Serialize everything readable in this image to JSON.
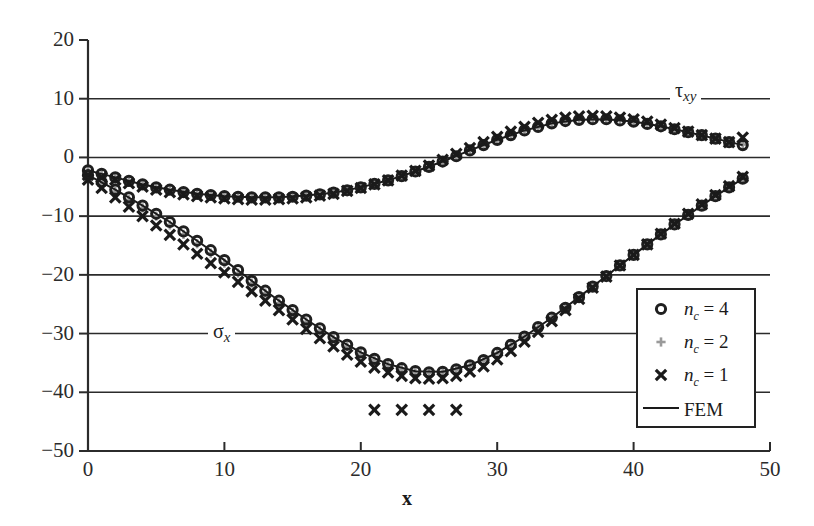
{
  "chart_data": {
    "type": "scatter",
    "title": "",
    "xlabel": "x",
    "ylabel": "",
    "xlim": [
      0,
      50
    ],
    "ylim": [
      -50,
      20
    ],
    "xticks": [
      "0",
      "10",
      "20",
      "30",
      "40",
      "50"
    ],
    "yticks": [
      "20",
      "10",
      "0",
      "-10",
      "-20",
      "-30",
      "-40",
      "-50"
    ],
    "grid": "horizontal",
    "legend_position": "lower-right-inside",
    "annotations": [
      {
        "text": "tau_xy",
        "x": 46.5,
        "y": 10
      },
      {
        "text": "sigma_x",
        "x": 10.5,
        "y": -30
      }
    ],
    "series": [
      {
        "name": "tau_xy FEM",
        "curve": "tau_xy",
        "marker": "line",
        "color": "#1a1a1a",
        "x": [
          0,
          2,
          4,
          6,
          8,
          10,
          12,
          14,
          16,
          18,
          20,
          22,
          24,
          26,
          28,
          30,
          32,
          34,
          36,
          38,
          40,
          42,
          44,
          46,
          48
        ],
        "y": [
          -2.2,
          -3.4,
          -4.6,
          -5.5,
          -6.2,
          -6.6,
          -6.8,
          -6.8,
          -6.5,
          -6.0,
          -5.1,
          -3.9,
          -2.4,
          -0.7,
          1.2,
          3.0,
          4.6,
          5.8,
          6.4,
          6.5,
          6.1,
          5.3,
          4.3,
          3.2,
          2.1
        ]
      },
      {
        "name": "tau_xy nc=4",
        "curve": "tau_xy",
        "marker": "circle",
        "color": "#1f1f1f",
        "x": [
          0,
          1,
          2,
          3,
          4,
          5,
          6,
          7,
          8,
          9,
          10,
          11,
          12,
          13,
          14,
          15,
          16,
          17,
          18,
          19,
          20,
          21,
          22,
          23,
          24,
          25,
          26,
          27,
          28,
          29,
          30,
          31,
          32,
          33,
          34,
          35,
          36,
          37,
          38,
          39,
          40,
          41,
          42,
          43,
          44,
          45,
          46,
          47,
          48
        ],
        "y": [
          -2.2,
          -2.8,
          -3.4,
          -4.0,
          -4.6,
          -5.1,
          -5.5,
          -5.9,
          -6.2,
          -6.4,
          -6.6,
          -6.7,
          -6.8,
          -6.8,
          -6.8,
          -6.7,
          -6.5,
          -6.3,
          -6.0,
          -5.6,
          -5.1,
          -4.5,
          -3.9,
          -3.2,
          -2.4,
          -1.6,
          -0.7,
          0.2,
          1.2,
          2.1,
          3.0,
          3.8,
          4.6,
          5.2,
          5.8,
          6.2,
          6.4,
          6.5,
          6.5,
          6.3,
          6.1,
          5.7,
          5.3,
          4.8,
          4.3,
          3.8,
          3.2,
          2.6,
          2.1
        ]
      },
      {
        "name": "tau_xy nc=2",
        "curve": "tau_xy",
        "marker": "plus",
        "color": "#9a9a9a",
        "x": [
          0,
          1,
          2,
          3,
          4,
          5,
          6,
          7,
          8,
          9,
          10,
          11,
          12,
          13,
          14,
          15,
          16,
          17,
          18,
          19,
          20,
          21,
          22,
          23,
          24,
          25,
          26,
          27,
          28,
          29,
          30,
          31,
          32,
          33,
          34,
          35,
          36,
          37,
          38,
          39,
          40,
          41,
          42,
          43,
          44,
          45,
          46,
          47,
          48
        ],
        "y": [
          -2.4,
          -3.0,
          -3.6,
          -4.2,
          -4.7,
          -5.2,
          -5.6,
          -6.0,
          -6.3,
          -6.5,
          -6.7,
          -6.8,
          -6.9,
          -6.9,
          -6.9,
          -6.8,
          -6.6,
          -6.4,
          -6.1,
          -5.7,
          -5.2,
          -4.6,
          -4.0,
          -3.3,
          -2.5,
          -1.7,
          -0.8,
          0.1,
          1.1,
          2.0,
          2.9,
          3.7,
          4.5,
          5.1,
          5.7,
          6.1,
          6.4,
          6.5,
          6.5,
          6.4,
          6.1,
          5.8,
          5.4,
          4.9,
          4.4,
          3.9,
          3.3,
          2.7,
          2.2
        ]
      },
      {
        "name": "tau_xy nc=1",
        "curve": "tau_xy",
        "marker": "cross",
        "color": "#1a1a1a",
        "x": [
          0,
          1,
          2,
          3,
          4,
          5,
          6,
          7,
          8,
          9,
          10,
          11,
          12,
          13,
          14,
          15,
          16,
          17,
          18,
          19,
          20,
          21,
          22,
          23,
          24,
          25,
          26,
          27,
          28,
          29,
          30,
          31,
          32,
          33,
          34,
          35,
          36,
          37,
          38,
          39,
          40,
          41,
          42,
          43,
          44,
          45,
          46,
          47,
          48
        ],
        "y": [
          -3.0,
          -3.4,
          -3.8,
          -4.4,
          -5.0,
          -5.5,
          -5.9,
          -6.3,
          -6.6,
          -6.8,
          -7.0,
          -7.1,
          -7.2,
          -7.2,
          -7.1,
          -7.0,
          -6.8,
          -6.5,
          -6.2,
          -5.7,
          -5.2,
          -4.6,
          -3.9,
          -3.1,
          -2.3,
          -1.4,
          -0.4,
          0.6,
          1.6,
          2.6,
          3.5,
          4.4,
          5.2,
          5.9,
          6.4,
          6.8,
          7.0,
          7.1,
          7.0,
          6.8,
          6.5,
          6.1,
          5.6,
          5.0,
          4.4,
          3.8,
          3.2,
          2.6,
          3.4
        ]
      },
      {
        "name": "sigma_x FEM",
        "curve": "sigma_x",
        "marker": "line",
        "color": "#1a1a1a",
        "x": [
          0,
          2,
          4,
          6,
          8,
          10,
          12,
          14,
          16,
          18,
          20,
          22,
          24,
          26,
          28,
          30,
          32,
          34,
          36,
          38,
          40,
          42,
          44,
          46,
          48
        ],
        "y": [
          -3.0,
          -5.5,
          -8.2,
          -11.0,
          -14.2,
          -17.5,
          -21.0,
          -24.4,
          -27.6,
          -30.6,
          -33.2,
          -35.2,
          -36.4,
          -36.5,
          -35.4,
          -33.3,
          -30.5,
          -27.3,
          -23.8,
          -20.2,
          -16.6,
          -13.1,
          -9.8,
          -6.6,
          -3.6
        ]
      },
      {
        "name": "sigma_x nc=4",
        "curve": "sigma_x",
        "marker": "circle",
        "color": "#1f1f1f",
        "x": [
          0,
          1,
          2,
          3,
          4,
          5,
          6,
          7,
          8,
          9,
          10,
          11,
          12,
          13,
          14,
          15,
          16,
          17,
          18,
          19,
          20,
          21,
          22,
          23,
          24,
          25,
          26,
          27,
          28,
          29,
          30,
          31,
          32,
          33,
          34,
          35,
          36,
          37,
          38,
          39,
          40,
          41,
          42,
          43,
          44,
          45,
          46,
          47,
          48
        ],
        "y": [
          -3.0,
          -4.2,
          -5.5,
          -6.8,
          -8.2,
          -9.6,
          -11.0,
          -12.6,
          -14.2,
          -15.8,
          -17.5,
          -19.2,
          -21.0,
          -22.7,
          -24.4,
          -26.0,
          -27.6,
          -29.1,
          -30.6,
          -31.9,
          -33.2,
          -34.3,
          -35.2,
          -35.9,
          -36.4,
          -36.6,
          -36.5,
          -36.1,
          -35.4,
          -34.5,
          -33.3,
          -31.9,
          -30.5,
          -28.9,
          -27.3,
          -25.6,
          -23.8,
          -22.0,
          -20.2,
          -18.4,
          -16.6,
          -14.8,
          -13.1,
          -11.4,
          -9.8,
          -8.2,
          -6.6,
          -5.1,
          -3.6
        ]
      },
      {
        "name": "sigma_x nc=2",
        "curve": "sigma_x",
        "marker": "plus",
        "color": "#9a9a9a",
        "x": [
          0,
          1,
          2,
          3,
          4,
          5,
          6,
          7,
          8,
          9,
          10,
          11,
          12,
          13,
          14,
          15,
          16,
          17,
          18,
          19,
          20,
          21,
          22,
          23,
          24,
          25,
          26,
          27,
          28,
          29,
          30,
          31,
          32,
          33,
          34,
          35,
          36,
          37,
          38,
          39,
          40,
          41,
          42,
          43,
          44,
          45,
          46,
          47,
          48
        ],
        "y": [
          -3.2,
          -4.5,
          -5.8,
          -7.2,
          -8.6,
          -10.0,
          -11.5,
          -13.1,
          -14.7,
          -16.3,
          -18.0,
          -19.7,
          -21.4,
          -23.1,
          -24.8,
          -26.4,
          -28.0,
          -29.5,
          -30.9,
          -32.2,
          -33.4,
          -34.5,
          -35.4,
          -36.1,
          -36.6,
          -36.7,
          -36.6,
          -36.2,
          -35.5,
          -34.6,
          -33.4,
          -32.0,
          -30.5,
          -28.9,
          -27.2,
          -25.5,
          -23.7,
          -21.9,
          -20.1,
          -18.3,
          -16.5,
          -14.7,
          -13.0,
          -11.3,
          -9.7,
          -8.1,
          -6.5,
          -5.0,
          -3.5
        ]
      },
      {
        "name": "sigma_x nc=1",
        "curve": "sigma_x",
        "marker": "cross",
        "color": "#1a1a1a",
        "x": [
          0,
          1,
          2,
          3,
          4,
          5,
          6,
          7,
          8,
          9,
          10,
          11,
          12,
          13,
          14,
          15,
          16,
          17,
          18,
          19,
          20,
          21,
          22,
          23,
          24,
          25,
          26,
          27,
          28,
          29,
          30,
          31,
          32,
          33,
          34,
          35,
          36,
          37,
          38,
          39,
          40,
          41,
          42,
          43,
          44,
          45,
          46,
          47,
          48
        ],
        "y": [
          -3.8,
          -5.2,
          -6.8,
          -8.4,
          -10.0,
          -11.6,
          -13.2,
          -14.8,
          -16.4,
          -18.0,
          -19.6,
          -21.2,
          -22.8,
          -24.4,
          -26.0,
          -27.6,
          -29.2,
          -30.8,
          -32.2,
          -33.6,
          -34.8,
          -35.8,
          -36.6,
          -37.2,
          -37.6,
          -37.7,
          -37.6,
          -37.2,
          -36.5,
          -35.6,
          -34.4,
          -33.0,
          -31.4,
          -29.7,
          -27.9,
          -26.0,
          -24.1,
          -22.2,
          -20.3,
          -18.4,
          -16.6,
          -14.8,
          -13.0,
          -11.3,
          -9.6,
          -8.0,
          -6.4,
          -4.9,
          -3.3
        ]
      },
      {
        "name": "sigma_x nc=1 outliers",
        "curve": "sigma_x",
        "marker": "cross",
        "color": "#1a1a1a",
        "x": [
          21,
          23,
          25,
          27
        ],
        "y": [
          -43.0,
          -43.0,
          -43.0,
          -43.0
        ]
      }
    ]
  },
  "axes": {
    "x_title": "x",
    "y_tick_labels": [
      "20",
      "10",
      "0",
      "-10",
      "-20",
      "-30",
      "-40",
      "-50"
    ],
    "x_tick_labels": [
      "0",
      "10",
      "20",
      "30",
      "40",
      "50"
    ]
  },
  "annotations": {
    "tau_label_main": "τ",
    "tau_label_sub": "xy",
    "sigma_label_main": "σ",
    "sigma_label_sub": "x"
  },
  "legend": {
    "rows": [
      {
        "symbol": "circle",
        "label_main": "n",
        "label_sub": "c",
        "label_rest": " = 4",
        "color": "#1f1f1f"
      },
      {
        "symbol": "plus",
        "label_main": "n",
        "label_sub": "c",
        "label_rest": " = 2",
        "color": "#9a9a9a"
      },
      {
        "symbol": "cross",
        "label_main": "n",
        "label_sub": "c",
        "label_rest": " = 1",
        "color": "#1a1a1a"
      },
      {
        "symbol": "line",
        "label_main": "FEM",
        "label_sub": "",
        "label_rest": "",
        "color": "#1a1a1a"
      }
    ]
  },
  "colors": {
    "axis": "#2b2b2b",
    "grid": "#2b2b2b",
    "marker_dark": "#1f1f1f",
    "marker_gray": "#9a9a9a",
    "background": "#ffffff"
  }
}
